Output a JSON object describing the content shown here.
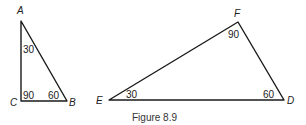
{
  "figure": {
    "caption": "Figure 8.9",
    "triangles": [
      {
        "name": "ABC",
        "vertices": {
          "A": {
            "label": "A",
            "angle": "30"
          },
          "B": {
            "label": "B",
            "angle": "60"
          },
          "C": {
            "label": "C",
            "angle": "90"
          }
        }
      },
      {
        "name": "DEF",
        "vertices": {
          "D": {
            "label": "D",
            "angle": "60"
          },
          "E": {
            "label": "E",
            "angle": "30"
          },
          "F": {
            "label": "F",
            "angle": "90"
          }
        }
      }
    ]
  }
}
